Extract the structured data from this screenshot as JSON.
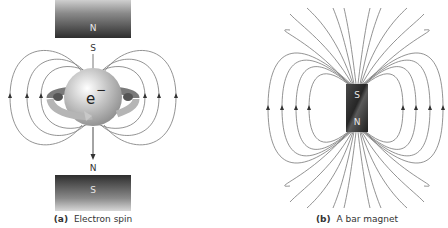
{
  "panel_a": {
    "caption_tag": "(a)",
    "caption_text": "Electron spin",
    "top_magnet_label": "N",
    "top_pole_label": "S",
    "electron_label": "e",
    "electron_charge": "−",
    "bottom_pole_label": "N",
    "bottom_magnet_label": "S"
  },
  "panel_b": {
    "caption_tag": "(b)",
    "caption_text": "A bar magnet",
    "magnet_top_label": "S",
    "magnet_bottom_label": "N"
  }
}
